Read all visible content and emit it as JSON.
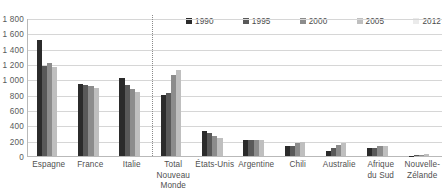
{
  "chart_data": {
    "type": "bar",
    "title": "",
    "subtitle": "",
    "xlabel": "",
    "ylabel": "",
    "ylim": [
      0,
      1800
    ],
    "ytick_step": 200,
    "yticks": [
      "1 800",
      "1 600",
      "1 400",
      "1 200",
      "1 000",
      "800",
      "600",
      "400",
      "200",
      "0"
    ],
    "grid": true,
    "legend_position": "top-right",
    "legend": [
      "1990",
      "1995",
      "2000",
      "2005",
      "2012"
    ],
    "series_colors": [
      "#2b2b2b",
      "#595959",
      "#8c8c8c",
      "#bfbfbf",
      "#ebebeb"
    ],
    "divider_after_category": "Italie",
    "categories": [
      "Espagne",
      "France",
      "Italie",
      "Total Nouveau Monde",
      "États-Unis",
      "Argentine",
      "Chili",
      "Australie",
      "Afrique du Sud",
      "Nouvelle-Zélande"
    ],
    "category_label_lines": [
      [
        "Espagne"
      ],
      [
        "France"
      ],
      [
        "Italie"
      ],
      [
        "Total",
        "Nouveau",
        "Monde"
      ],
      [
        "États-Unis"
      ],
      [
        "Argentine"
      ],
      [
        "Chili"
      ],
      [
        "Australie"
      ],
      [
        "Afrique",
        "du Sud"
      ],
      [
        "Nouvelle-",
        "Zélande"
      ]
    ],
    "series": [
      {
        "name": "1990",
        "values": [
          1515,
          935,
          1015,
          800,
          330,
          205,
          130,
          60,
          110,
          5
        ]
      },
      {
        "name": "1995",
        "values": [
          1180,
          920,
          920,
          825,
          300,
          210,
          125,
          100,
          110,
          10
        ]
      },
      {
        "name": "2000",
        "values": [
          1215,
          910,
          870,
          1055,
          260,
          205,
          175,
          150,
          125,
          15
        ]
      },
      {
        "name": "2005",
        "values": [
          1165,
          885,
          840,
          1125,
          240,
          210,
          185,
          165,
          130,
          20
        ]
      },
      {
        "name": "2012",
        "values": [
          0,
          0,
          0,
          0,
          0,
          0,
          0,
          0,
          0,
          0
        ]
      }
    ]
  }
}
